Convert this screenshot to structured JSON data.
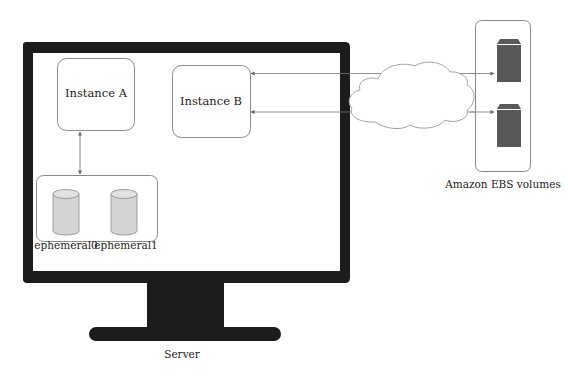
{
  "diagram": {
    "server": {
      "label": "Server"
    },
    "instances": [
      {
        "id": "a",
        "label": "Instance A"
      },
      {
        "id": "b",
        "label": "Instance B"
      }
    ],
    "ephemeral_store": {
      "volumes": [
        {
          "label": "ephemeral0"
        },
        {
          "label": "ephemeral1"
        }
      ]
    },
    "network": {
      "label": ""
    },
    "ebs": {
      "label": "Amazon EBS volumes",
      "volume_count": 2,
      "volume_color": "#585858"
    },
    "connections": [
      {
        "from": "Instance A",
        "to": "ephemeral store",
        "type": "bidirectional"
      },
      {
        "from": "Instance B",
        "to": "EBS volume 1",
        "via": "cloud"
      },
      {
        "from": "Instance B",
        "to": "EBS volume 2",
        "via": "cloud"
      }
    ],
    "colors": {
      "monitor": "#1c1c1c",
      "box_stroke": "#8a8a8a",
      "cylinder_fill": "#d4d4d4",
      "text": "#222222"
    }
  }
}
